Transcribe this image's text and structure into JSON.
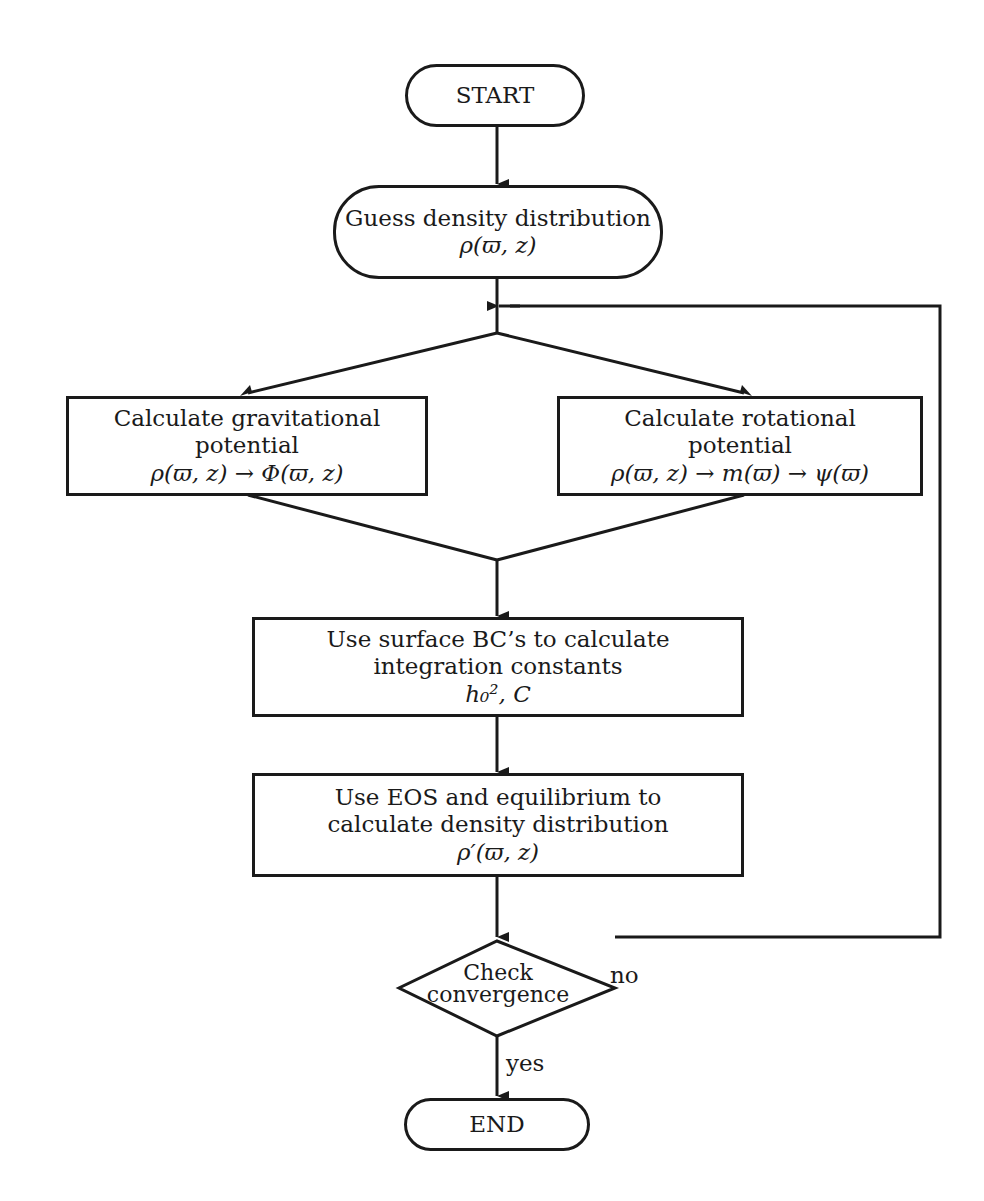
{
  "flowchart": {
    "start": {
      "label": "START"
    },
    "guess": {
      "line1": "Guess density distribution",
      "math": "ρ(ϖ, z)"
    },
    "gravitational": {
      "line1": "Calculate gravitational",
      "line2": "potential",
      "math": "ρ(ϖ, z) → Φ(ϖ, z)"
    },
    "rotational": {
      "line1": "Calculate rotational",
      "line2": "potential",
      "math": "ρ(ϖ, z) → m(ϖ) → ψ(ϖ)"
    },
    "surface_bc": {
      "line1": "Use surface BC’s to calculate",
      "line2": "integration constants",
      "math": "h₀², C"
    },
    "eos": {
      "line1": "Use EOS and equilibrium to",
      "line2": "calculate density distribution",
      "math": "ρ′(ϖ, z)"
    },
    "check": {
      "line1": "Check",
      "line2": "convergence"
    },
    "edge_no": "no",
    "edge_yes": "yes",
    "end": {
      "label": "END"
    }
  },
  "colors": {
    "stroke": "#1a1a1a",
    "background": "#ffffff"
  }
}
